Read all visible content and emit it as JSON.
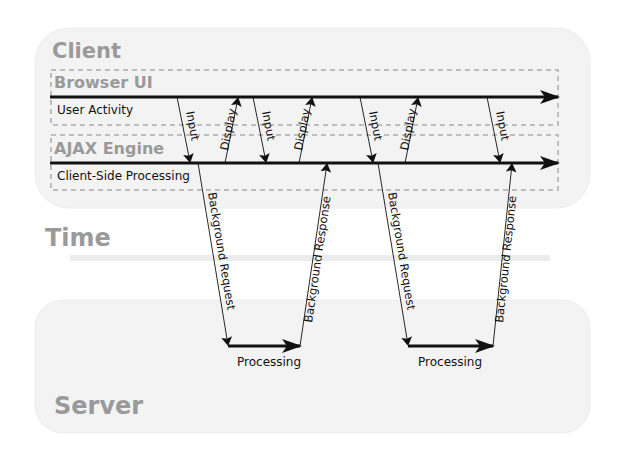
{
  "diagram": {
    "regions": {
      "client": {
        "label": "Client"
      },
      "browser_ui": {
        "label": "Browser UI",
        "lane_label": "User Activity"
      },
      "ajax_engine": {
        "label": "AJAX Engine",
        "lane_label": "Client-Side Processing"
      },
      "time": {
        "label": "Time"
      },
      "server": {
        "label": "Server"
      }
    },
    "arrows": {
      "input_1": "Input",
      "display_1": "Display",
      "input_2": "Input",
      "display_2": "Display",
      "input_3": "Input",
      "display_3": "Display",
      "input_4": "Input",
      "bg_request_1": "Background Request",
      "bg_response_1": "Background Response",
      "bg_request_2": "Background Request",
      "bg_response_2": "Background Response",
      "processing_1": "Processing",
      "processing_2": "Processing"
    },
    "colors": {
      "region_fill": "#f3f3f3",
      "region_label": "#9a9a9a",
      "dashed_border": "#bdbdbd",
      "arrow": "#111111"
    }
  }
}
